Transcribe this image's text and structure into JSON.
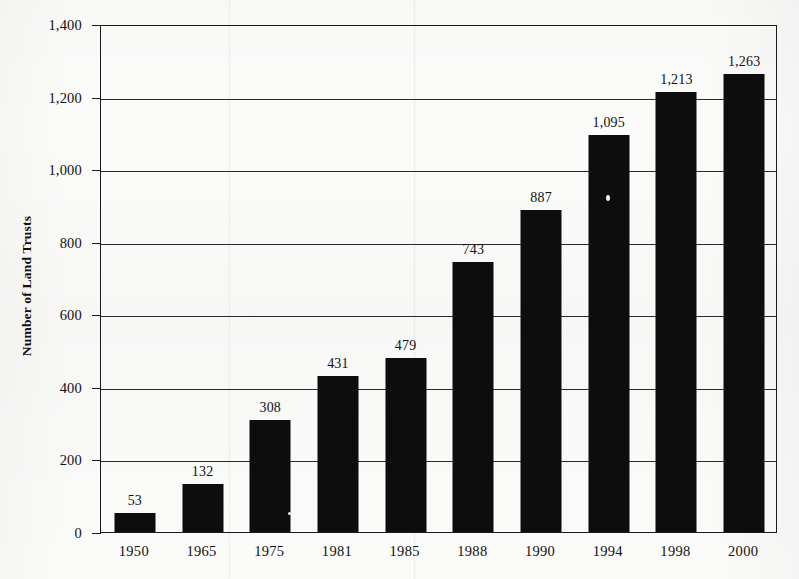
{
  "chart_data": {
    "type": "bar",
    "title": "",
    "xlabel": "",
    "ylabel": "Number of Land Trusts",
    "categories": [
      "1950",
      "1965",
      "1975",
      "1981",
      "1985",
      "1988",
      "1990",
      "1994",
      "1998",
      "2000"
    ],
    "values": [
      53,
      132,
      308,
      431,
      479,
      743,
      887,
      1095,
      1213,
      1263
    ],
    "value_labels": [
      "53",
      "132",
      "308",
      "431",
      "479",
      "743",
      "887",
      "1,095",
      "1,213",
      "1,263"
    ],
    "ylim": [
      0,
      1400
    ],
    "ytick_values": [
      0,
      200,
      400,
      600,
      800,
      1000,
      1200,
      1400
    ],
    "ytick_labels": [
      "0",
      "200",
      "400",
      "600",
      "800",
      "1,000",
      "1,200",
      "1,400"
    ],
    "grid": true,
    "grid_axis": "y",
    "legend": "none",
    "bar_color": "#0d0d0d",
    "axis_color": "#1a1a1a",
    "background_color": "#fbfbfa"
  }
}
